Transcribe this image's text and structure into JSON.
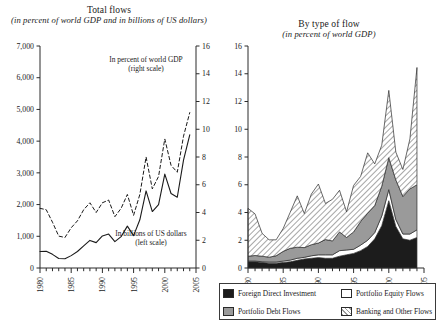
{
  "figure": {
    "width": 440,
    "height": 324
  },
  "panels": {
    "left": {
      "title_main": "Total flows",
      "title_sub": "(in percent of world GDP and in billions of US dollars)",
      "annotation_pct_line1": "In percent of world GDP",
      "annotation_pct_line2": "(right scale)",
      "annotation_bil_line1": "In billions of US dollars",
      "annotation_bil_line2": "(left scale)",
      "y_left_ticks": [
        "0",
        "1,000",
        "2,000",
        "3,000",
        "4,000",
        "5,000",
        "6,000",
        "7,000"
      ],
      "y_right_ticks": [
        "0",
        "2",
        "4",
        "6",
        "8",
        "10",
        "12",
        "14",
        "16"
      ],
      "x_ticks": [
        "1980",
        "1985",
        "1990",
        "1995",
        "2000",
        "2005"
      ]
    },
    "right": {
      "title_main": "By type of flow",
      "title_sub": "(in percent of world GDP)",
      "y_ticks": [
        "0",
        "2",
        "4",
        "6",
        "8",
        "10",
        "12",
        "14",
        "16"
      ],
      "x_ticks": [
        "1980",
        "1985",
        "1990",
        "1995",
        "2000",
        "2005"
      ]
    }
  },
  "legend": {
    "items": [
      {
        "label": "Foreign Direct Investment",
        "swatch": "sw-fdi",
        "color": "#1c1c1c"
      },
      {
        "label": "Portfolio Equity Flows",
        "swatch": "sw-eq",
        "color": "#ffffff"
      },
      {
        "label": "Portfolio Debt Flows",
        "swatch": "sw-debt",
        "color": "#9a9a9a"
      },
      {
        "label": "Banking and Other Flows",
        "swatch": "sw-bank",
        "color": "#9d9d9d"
      }
    ]
  },
  "chart_data": [
    {
      "id": "total-flows",
      "type": "line",
      "title": "Total flows",
      "subtitle": "(in percent of world GDP and in billions of US dollars)",
      "xlabel": "",
      "x": [
        1980,
        1981,
        1982,
        1983,
        1984,
        1985,
        1986,
        1987,
        1988,
        1989,
        1990,
        1991,
        1992,
        1993,
        1994,
        1995,
        1996,
        1997,
        1998,
        1999,
        2000,
        2001,
        2002,
        2003,
        2004
      ],
      "axes": [
        {
          "name": "left",
          "ylabel": "In billions of US dollars (left scale)",
          "ylim": [
            0,
            7000
          ],
          "yticks": [
            0,
            1000,
            2000,
            3000,
            4000,
            5000,
            6000,
            7000
          ],
          "tick_labels": [
            "0",
            "1,000",
            "2,000",
            "3,000",
            "4,000",
            "5,000",
            "6,000",
            "7,000"
          ]
        },
        {
          "name": "right",
          "ylabel": "In percent of world GDP (right scale)",
          "ylim": [
            0,
            16
          ],
          "yticks": [
            0,
            2,
            4,
            6,
            8,
            10,
            12,
            14,
            16
          ],
          "tick_labels": [
            "0",
            "2",
            "4",
            "6",
            "8",
            "10",
            "12",
            "14",
            "16"
          ]
        }
      ],
      "series": [
        {
          "name": "In billions of US dollars",
          "axis": "left",
          "style": "solid",
          "values": [
            520,
            530,
            430,
            300,
            290,
            390,
            520,
            700,
            870,
            800,
            1010,
            1070,
            830,
            990,
            1320,
            1020,
            1520,
            2430,
            1780,
            2000,
            2960,
            2350,
            2230,
            3400,
            4200
          ]
        },
        {
          "name": "In percent of world GDP",
          "axis": "right",
          "style": "dashed",
          "values": [
            4.3,
            4.2,
            3.3,
            2.3,
            2.2,
            2.9,
            3.4,
            4.2,
            4.7,
            4.0,
            4.7,
            4.9,
            3.7,
            4.3,
            5.3,
            3.8,
            5.3,
            8.0,
            5.7,
            6.6,
            9.3,
            7.4,
            6.9,
            9.5,
            11.2
          ]
        }
      ],
      "grid": false,
      "legend_position": "inline-annotations"
    },
    {
      "id": "by-type-of-flow",
      "type": "area",
      "stacked": true,
      "title": "By type of flow",
      "subtitle": "(in percent of world GDP)",
      "xlabel": "",
      "ylabel": "",
      "ylim": [
        0,
        16
      ],
      "yticks": [
        0,
        2,
        4,
        6,
        8,
        10,
        12,
        14,
        16
      ],
      "tick_labels": [
        "0",
        "2",
        "4",
        "6",
        "8",
        "10",
        "12",
        "14",
        "16"
      ],
      "x": [
        1980,
        1981,
        1982,
        1983,
        1984,
        1985,
        1986,
        1987,
        1988,
        1989,
        1990,
        1991,
        1992,
        1993,
        1994,
        1995,
        1996,
        1997,
        1998,
        1999,
        2000,
        2001,
        2002,
        2003,
        2004
      ],
      "series": [
        {
          "name": "Foreign Direct Investment",
          "fill": "#1c1c1c",
          "values": [
            0.45,
            0.45,
            0.4,
            0.35,
            0.35,
            0.4,
            0.45,
            0.55,
            0.65,
            0.7,
            0.75,
            0.7,
            0.7,
            0.85,
            0.95,
            1.05,
            1.25,
            1.55,
            2.1,
            3.05,
            4.85,
            3.0,
            2.1,
            2.0,
            2.2
          ]
        },
        {
          "name": "Portfolio Equity Flows",
          "fill": "#ffffff",
          "values": [
            0.05,
            0.05,
            0.05,
            0.08,
            0.08,
            0.1,
            0.12,
            0.15,
            0.12,
            0.18,
            0.2,
            0.25,
            0.25,
            0.4,
            0.35,
            0.3,
            0.4,
            0.45,
            0.45,
            0.7,
            0.8,
            0.5,
            0.35,
            0.45,
            0.55
          ]
        },
        {
          "name": "Portfolio Debt Flows",
          "fill": "#9a9a9a",
          "values": [
            0.35,
            0.4,
            0.4,
            0.35,
            0.45,
            0.7,
            0.85,
            0.8,
            0.7,
            0.8,
            0.85,
            1.1,
            1.0,
            1.35,
            0.9,
            1.25,
            1.7,
            1.95,
            1.95,
            2.15,
            2.3,
            2.85,
            2.7,
            3.25,
            3.25
          ]
        },
        {
          "name": "Banking and Other Flows",
          "fill": "#9d9d9d",
          "hatch": "diagonal",
          "values": [
            3.45,
            3.0,
            1.65,
            1.25,
            1.15,
            1.65,
            2.6,
            3.7,
            2.45,
            3.65,
            4.25,
            2.6,
            3.0,
            3.0,
            1.85,
            3.35,
            3.25,
            4.35,
            3.0,
            2.95,
            4.85,
            2.0,
            1.95,
            3.6,
            8.45
          ]
        }
      ],
      "grid": false,
      "legend_position": "bottom"
    }
  ]
}
